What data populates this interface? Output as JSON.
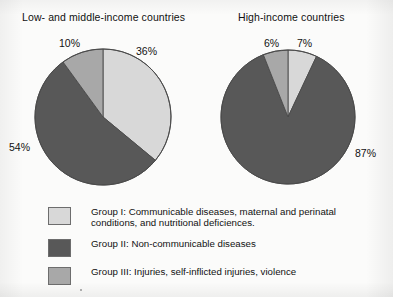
{
  "chart_data": [
    {
      "type": "pie",
      "title": "Low- and middle-income countries",
      "categories": [
        "Group I",
        "Group II",
        "Group III"
      ],
      "values": [
        36,
        54,
        10
      ],
      "labels": [
        "36%",
        "54%",
        "10%"
      ],
      "start_angle_deg": 0,
      "direction": "clockwise",
      "center": [
        103,
        117
      ],
      "radius": 68
    },
    {
      "type": "pie",
      "title": "High-income countries",
      "categories": [
        "Group I",
        "Group II",
        "Group III"
      ],
      "values": [
        7,
        87,
        6
      ],
      "labels": [
        "7%",
        "87%",
        "6%"
      ],
      "start_angle_deg": 0,
      "direction": "clockwise",
      "center": [
        288,
        117
      ],
      "radius": 67
    }
  ],
  "colors": {
    "group1": "#d8d8d8",
    "group2": "#585858",
    "group3": "#a8a8a8",
    "outline": "#4a4a4a",
    "background": "#fbfbfa"
  },
  "titles": {
    "left": "Low- and middle-income countries",
    "right": "High-income countries"
  },
  "labels": {
    "left_group1": "36%",
    "left_group2": "54%",
    "left_group3": "10%",
    "right_group1": "7%",
    "right_group2": "87%",
    "right_group3": "6%"
  },
  "legend": {
    "items": [
      {
        "key": "group1",
        "color": "#d8d8d8",
        "text": "Group I: Communicable diseases, maternal and perinatal conditions, and nutritional deficiences."
      },
      {
        "key": "group2",
        "color": "#585858",
        "text": "Group II: Non-communicable diseases"
      },
      {
        "key": "group3",
        "color": "#a8a8a8",
        "text": "Group III: Injuries, self-inflicted injuries, violence"
      }
    ]
  }
}
